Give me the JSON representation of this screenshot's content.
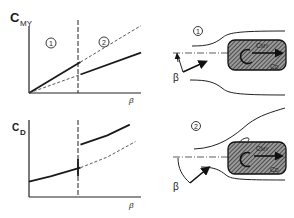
{
  "charts": {
    "top": {
      "ylabel_main": "C",
      "ylabel_sub": "MY",
      "xlabel": "β",
      "region_1": "1",
      "region_2": "2"
    },
    "bottom": {
      "ylabel_main": "C",
      "ylabel_sub": "D",
      "xlabel": "β"
    }
  },
  "chart_data": [
    {
      "type": "line",
      "title": "",
      "ylabel": "C_MY",
      "xlabel": "β",
      "transition_beta": 0.46,
      "regions": [
        "1",
        "2"
      ],
      "series": [
        {
          "name": "regime 1 (solid)",
          "style": "solid",
          "x": [
            0,
            0.46
          ],
          "y": [
            0,
            0.55
          ]
        },
        {
          "name": "regime 1 extrapolated (dashed)",
          "style": "dashed",
          "x": [
            0.46,
            1.0
          ],
          "y": [
            0.55,
            1.2
          ]
        },
        {
          "name": "regime 2 (dashed)",
          "style": "dashed",
          "x": [
            0,
            0.46
          ],
          "y": [
            0,
            0.33
          ]
        },
        {
          "name": "regime 2 (solid)",
          "style": "solid",
          "x": [
            0.46,
            1.0
          ],
          "y": [
            0.33,
            0.72
          ]
        }
      ],
      "xlim": [
        0,
        1
      ],
      "ylim": [
        0,
        1.3
      ]
    },
    {
      "type": "line",
      "title": "",
      "ylabel": "C_D",
      "xlabel": "β",
      "transition_beta": 0.46,
      "series": [
        {
          "name": "regime 1 (solid)",
          "style": "solid",
          "x": [
            0,
            0.2,
            0.46
          ],
          "y": [
            0.2,
            0.27,
            0.38
          ]
        },
        {
          "name": "regime 1 extrapolated (dashed)",
          "style": "dashed",
          "x": [
            0.46,
            0.7,
            0.95
          ],
          "y": [
            0.38,
            0.52,
            0.72
          ]
        },
        {
          "name": "regime 2 (solid)",
          "style": "solid",
          "x": [
            0.46,
            0.7,
            0.9
          ],
          "y": [
            0.68,
            0.8,
            0.94
          ]
        }
      ],
      "xlim": [
        0,
        1
      ],
      "ylim": [
        0,
        1
      ]
    }
  ],
  "diagrams": {
    "regime_1": {
      "label": "1",
      "beta": "β",
      "moment_label": "C",
      "moment_sub": "MY",
      "drag_label": "C",
      "drag_sub": "D"
    },
    "regime_2": {
      "label": "2",
      "beta": "β",
      "moment_label": "C",
      "moment_sub": "MY",
      "drag_label": "C",
      "drag_sub": "D"
    }
  }
}
